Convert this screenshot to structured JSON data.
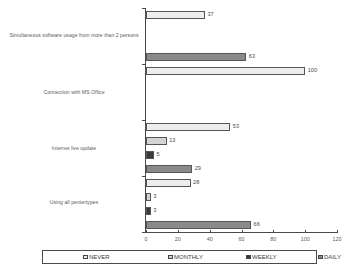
{
  "chart_data": {
    "type": "bar",
    "orientation": "horizontal",
    "title": "",
    "xlabel": "",
    "ylabel": "",
    "xlim": [
      0,
      120
    ],
    "xticks": [
      0,
      20,
      40,
      60,
      80,
      100,
      120
    ],
    "grid": false,
    "legend_position": "bottom",
    "categories": [
      "Simultaneous software usage from more than 2 persons",
      "Connection with MS Office",
      "Internet live update",
      "Using all pentertypes"
    ],
    "series": [
      {
        "name": "NEVER",
        "color": "#ededed",
        "values": [
          37,
          100,
          53,
          28
        ]
      },
      {
        "name": "MONTHLY",
        "color": "#d4d4d4",
        "values": [
          null,
          null,
          13,
          3
        ]
      },
      {
        "name": "WEEKLY",
        "color": "#3a3a3a",
        "values": [
          null,
          null,
          5,
          3
        ]
      },
      {
        "name": "DAILY",
        "color": "#8a8a8a",
        "values": [
          63,
          null,
          29,
          66
        ]
      }
    ]
  },
  "legend": {
    "items": [
      {
        "label": "NEVER"
      },
      {
        "label": "MONTHLY"
      },
      {
        "label": "WEEKLY"
      },
      {
        "label": "DAILY"
      }
    ]
  }
}
